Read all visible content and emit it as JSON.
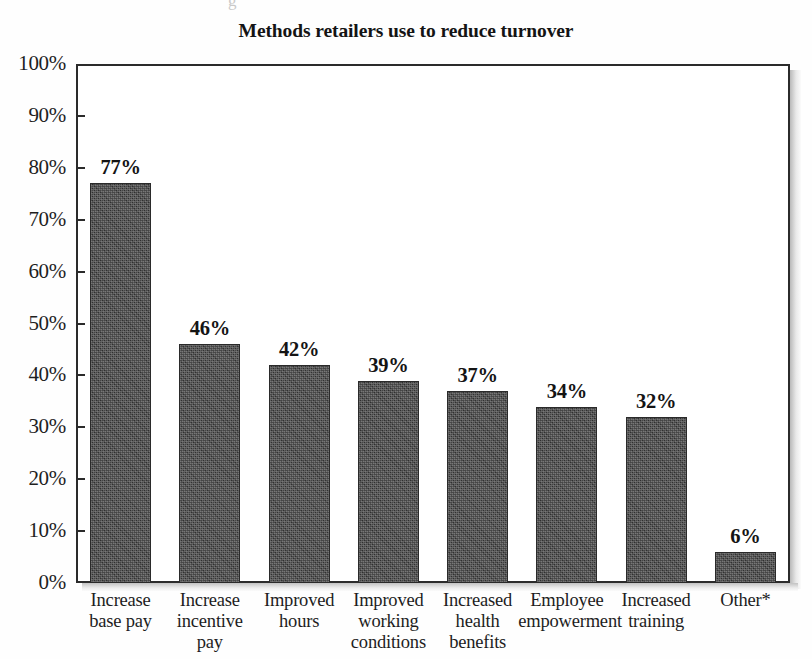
{
  "chart_data": {
    "type": "bar",
    "title": "Methods retailers use to reduce turnover",
    "xlabel": "",
    "ylabel": "",
    "ylim": [
      0,
      100
    ],
    "y_tick_labels": [
      "100%",
      "90%",
      "80%",
      "70%",
      "60%",
      "50%",
      "40%",
      "30%",
      "20%",
      "10%",
      "0%"
    ],
    "y_ticks": [
      100,
      90,
      80,
      70,
      60,
      50,
      40,
      30,
      20,
      10,
      0
    ],
    "grid": false,
    "legend": null,
    "categories": [
      "Increase base pay",
      "Increase incentive pay",
      "Improved hours",
      "Improved working conditions",
      "Increased health benefits",
      "Employee empowerment",
      "Increased training",
      "Other*"
    ],
    "category_lines": [
      [
        "Increase",
        "base pay"
      ],
      [
        "Increase",
        "incentive",
        "pay"
      ],
      [
        "Improved",
        "hours"
      ],
      [
        "Improved",
        "working",
        "conditions"
      ],
      [
        "Increased",
        "health",
        "benefits"
      ],
      [
        "Employee",
        "empowerment"
      ],
      [
        "Increased",
        "training"
      ],
      [
        "Other*"
      ]
    ],
    "values": [
      77,
      46,
      42,
      39,
      37,
      34,
      32,
      6
    ],
    "value_labels": [
      "77%",
      "46%",
      "42%",
      "39%",
      "37%",
      "34%",
      "32%",
      "6%"
    ],
    "bar_color": "#3b3b3b",
    "axis_color": "#2b2b2b",
    "background_color": "#ffffff"
  },
  "artifact": {
    "top_fragment": "g"
  }
}
